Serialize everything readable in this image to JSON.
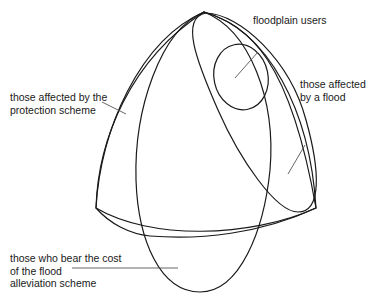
{
  "diagram": {
    "title": "",
    "labels": {
      "floodplain_users": {
        "lines": [
          "floodplain users"
        ]
      },
      "affected_by_flood": {
        "lines": [
          "those affected",
          "by a flood"
        ]
      },
      "affected_by_protection": {
        "lines": [
          "those affected by the",
          "protection scheme"
        ]
      },
      "bear_cost": {
        "lines": [
          "those who bear the cost",
          "of the flood",
          "alleviation scheme"
        ]
      }
    },
    "sets": [
      "those affected by the protection scheme",
      "those affected by a flood",
      "floodplain users",
      "those who bear the cost of the flood alleviation scheme"
    ],
    "colors": {
      "stroke": "#1a1a1a",
      "leader": "#555555",
      "background": "#ffffff"
    }
  }
}
